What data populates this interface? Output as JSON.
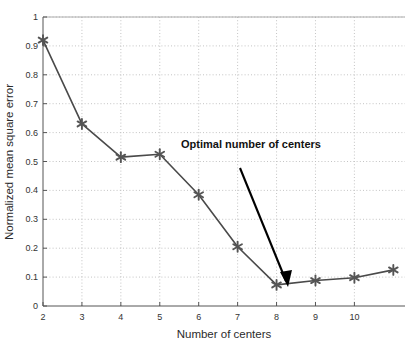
{
  "chart_data": {
    "type": "line",
    "title": "",
    "subtitle": "",
    "xlabel": "Number of centers",
    "ylabel": "Normalized mean square error",
    "x": [
      2,
      3,
      4,
      5,
      6,
      7,
      8,
      9,
      10,
      11
    ],
    "values": [
      0.92,
      0.63,
      0.515,
      0.525,
      0.385,
      0.205,
      0.073,
      0.088,
      0.098,
      0.125
    ],
    "series": [
      {
        "name": "Normalized mean square error",
        "values": [
          0.92,
          0.63,
          0.515,
          0.525,
          0.385,
          0.205,
          0.073,
          0.088,
          0.098,
          0.125
        ]
      }
    ],
    "xlim": [
      2,
      11.3
    ],
    "ylim": [
      0,
      1
    ],
    "xticks": [
      2,
      3,
      4,
      5,
      6,
      7,
      8,
      9,
      10
    ],
    "xtick_labels": [
      "2",
      "3",
      "4",
      "5",
      "6",
      "7",
      "8",
      "9",
      "10"
    ],
    "yticks": [
      0,
      0.1,
      0.2,
      0.3,
      0.4,
      0.5,
      0.6,
      0.7,
      0.8,
      0.9,
      1
    ],
    "ytick_labels": [
      "0",
      "0.1",
      "0.2",
      "0.3",
      "0.4",
      "0.5",
      "0.6",
      "0.7",
      "0.8",
      "0.9",
      "1"
    ],
    "grid": true,
    "grid_style": "dotted",
    "legend": "none",
    "marker": "asterisk",
    "line_color": "#4a4a4a",
    "marker_color": "#555555",
    "grid_color": "#bdbdbd",
    "axis_color": "#555555",
    "annotations": [
      {
        "text": "Optimal number of centers",
        "points_to_x": 8,
        "points_to_y": 0.073,
        "arrow_color": "#000000"
      }
    ]
  },
  "axes": {
    "x_title": "Number of centers",
    "y_title": "Normalized mean square error"
  },
  "annotation": {
    "label": "Optimal number of centers"
  },
  "ticks": {
    "x": [
      "2",
      "3",
      "4",
      "5",
      "6",
      "7",
      "8",
      "9",
      "10"
    ],
    "y": [
      "1",
      "0.9",
      "0.8",
      "0.7",
      "0.6",
      "0.5",
      "0.4",
      "0.3",
      "0.2",
      "0.1",
      "0"
    ]
  }
}
